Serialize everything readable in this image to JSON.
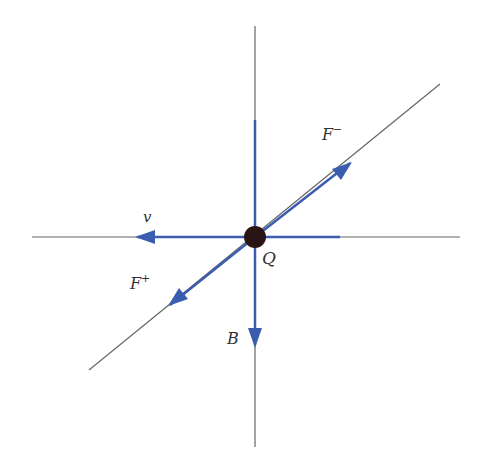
{
  "diagram": {
    "colors": {
      "axis_line": "#666666",
      "vector": "#3b5db0",
      "charge": "#2a1414",
      "label": "#333333"
    },
    "charge": {
      "label": "Q",
      "x": 255,
      "y": 237
    },
    "vectors": [
      {
        "id": "v",
        "label": "v",
        "direction": "left"
      },
      {
        "id": "B",
        "label": "B",
        "direction": "down"
      },
      {
        "id": "F_plus",
        "label": "F+",
        "label_main": "F",
        "label_sup": "+",
        "direction": "down-left"
      },
      {
        "id": "F_minus",
        "label": "F−",
        "label_main": "F",
        "label_sup": "−",
        "direction": "up-right"
      }
    ]
  }
}
